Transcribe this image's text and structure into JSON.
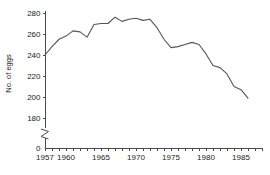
{
  "chart_data": {
    "type": "line",
    "title": "",
    "xlabel": "",
    "ylabel": "No. of eggs",
    "xlim": [
      1957,
      1986
    ],
    "ylim": [
      180,
      280
    ],
    "y_axis_break": true,
    "y_break_from": 0,
    "y_break_to": 180,
    "grid": false,
    "legend": "none",
    "y_ticks": [
      280,
      260,
      240,
      220,
      200,
      180
    ],
    "y_zero_label": "0",
    "x_ticks_labeled": [
      1957,
      1960,
      1965,
      1970,
      1975,
      1980,
      1985
    ],
    "x_tick_interval": 1,
    "x": [
      1957,
      1958,
      1959,
      1960,
      1961,
      1962,
      1963,
      1964,
      1965,
      1966,
      1967,
      1968,
      1969,
      1970,
      1971,
      1972,
      1973,
      1974,
      1975,
      1976,
      1977,
      1978,
      1979,
      1980,
      1981,
      1982,
      1983,
      1984,
      1985,
      1986
    ],
    "values": [
      240,
      248,
      255,
      258,
      263,
      262,
      257,
      269,
      270,
      270,
      276,
      272,
      274,
      275,
      273,
      274,
      266,
      255,
      247,
      248,
      250,
      252,
      250,
      241,
      230,
      228,
      222,
      210,
      207,
      199
    ],
    "series": [
      {
        "name": "No. of eggs",
        "values": [
          240,
          248,
          255,
          258,
          263,
          262,
          257,
          269,
          270,
          270,
          276,
          272,
          274,
          275,
          273,
          274,
          266,
          255,
          247,
          248,
          250,
          252,
          250,
          241,
          230,
          228,
          222,
          210,
          207,
          199
        ]
      }
    ],
    "line_color": "#555555",
    "axis_color": "#4a4a4a",
    "background_color": "#ffffff"
  }
}
